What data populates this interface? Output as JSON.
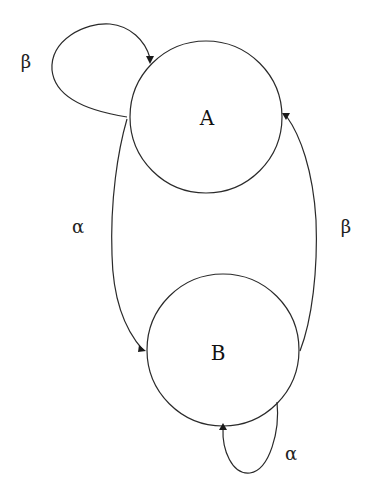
{
  "diagram": {
    "type": "state-transition-diagram",
    "nodes": [
      {
        "id": "A",
        "label": "A"
      },
      {
        "id": "B",
        "label": "B"
      }
    ],
    "edges": [
      {
        "from": "A",
        "to": "A",
        "label": "β",
        "kind": "self-loop"
      },
      {
        "from": "A",
        "to": "B",
        "label": "α"
      },
      {
        "from": "B",
        "to": "A",
        "label": "β"
      },
      {
        "from": "B",
        "to": "B",
        "label": "α",
        "kind": "self-loop"
      }
    ]
  }
}
